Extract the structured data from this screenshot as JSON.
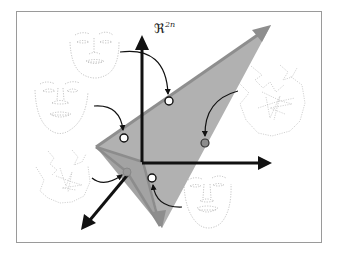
{
  "figure": {
    "space_label": "ℜ",
    "space_superscript": "2n",
    "colors": {
      "frame": "#9a9a9a",
      "axis": "#111111",
      "subspace_fill": "#a8a8a8",
      "subspace_edge": "#8c8c8c",
      "subspace_arrow": "#8e8e8e",
      "landmark": "#9a9a9a",
      "point_open": "#ffffff",
      "point_filled": "#8c8c8c"
    },
    "faces": [
      {
        "id": "top-face",
        "type": "valid-frontal"
      },
      {
        "id": "left-face",
        "type": "valid-frontal"
      },
      {
        "id": "right-face-scrambled",
        "type": "invalid-scrambled"
      },
      {
        "id": "left-bottom-face-scrambled",
        "type": "invalid-scrambled"
      },
      {
        "id": "bottom-face",
        "type": "valid-smiling"
      }
    ],
    "points": [
      {
        "id": "p-top",
        "style": "open",
        "in_subspace": true
      },
      {
        "id": "p-left",
        "style": "open",
        "in_subspace": true
      },
      {
        "id": "p-right",
        "style": "filled",
        "in_subspace": false
      },
      {
        "id": "p-lower-left",
        "style": "filled",
        "in_subspace": true
      },
      {
        "id": "p-bottom",
        "style": "open",
        "in_subspace": true
      }
    ]
  }
}
